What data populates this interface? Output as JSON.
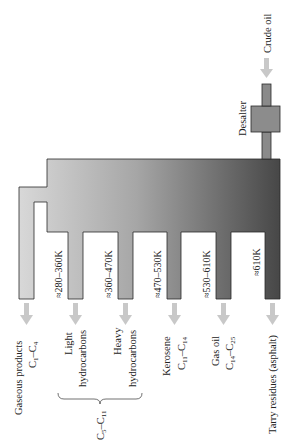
{
  "diagram": {
    "orientation": "rotated -90deg (text reads bottom-to-top)",
    "input": {
      "label": "Crude oil"
    },
    "desalter": {
      "label": "Desalter"
    },
    "colors": {
      "column_light": "#d6d6d6",
      "column_dark": "#4a4a4a",
      "desalter_fill": "#8a8a8a",
      "arrow": "#c8c8c8",
      "outline": "#2a2a2a"
    },
    "fractions": [
      {
        "id": "gaseous",
        "name": "Gaseous products",
        "formula_prefix": "C",
        "formula_a": "1",
        "formula_b": "4",
        "temperature": ""
      },
      {
        "id": "light",
        "name_line1": "Light",
        "name_line2": "hydrocarbons",
        "temperature": "≈280–360K"
      },
      {
        "id": "heavy",
        "name_line1": "Heavy",
        "name_line2": "hydrocarbons",
        "temperature": "≈360–470K"
      },
      {
        "id": "kerosene",
        "name": "Kerosene",
        "formula_a": "11",
        "formula_b": "14",
        "temperature": "≈470–530K"
      },
      {
        "id": "gas-oil",
        "name": "Gas oil",
        "formula_a": "14",
        "formula_b": "25",
        "temperature": "≈530–610K"
      },
      {
        "id": "tarry",
        "name": "Tarry residues (asphalt)",
        "temperature": "≈610K"
      }
    ],
    "group_brace": {
      "label_a": "5",
      "label_b": "11",
      "spans": [
        "light",
        "heavy"
      ]
    }
  }
}
